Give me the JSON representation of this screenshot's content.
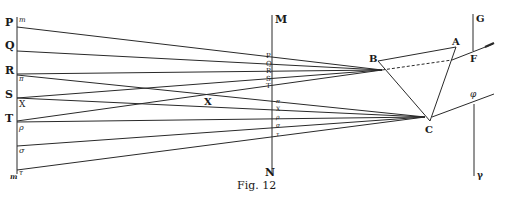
{
  "figure": {
    "caption": "Fig. 12",
    "colors": {
      "line": "#2a2a2a",
      "background": "#ffffff"
    }
  },
  "left_axis": {
    "upper_labels": [
      "P",
      "Q",
      "R",
      "S",
      "T"
    ],
    "lower_labels": [
      "m",
      "π",
      "X",
      "ρ",
      "σ",
      "τ"
    ],
    "bottom_label": "m"
  },
  "screen_mn": {
    "top_label": "M",
    "bottom_label": "N",
    "upper_labels": [
      "P",
      "Q",
      "R",
      "S",
      "T"
    ],
    "lower_labels": [
      "π",
      "X",
      "ρ",
      "σ",
      "τ"
    ]
  },
  "middle": {
    "crossing_label": "X"
  },
  "prism": {
    "vertices": [
      "A",
      "B",
      "C"
    ]
  },
  "right_screen": {
    "upper_top_label": "G",
    "upper_point_label": "F",
    "lower_point_label": "φ",
    "lower_bottom_label": "γ"
  }
}
